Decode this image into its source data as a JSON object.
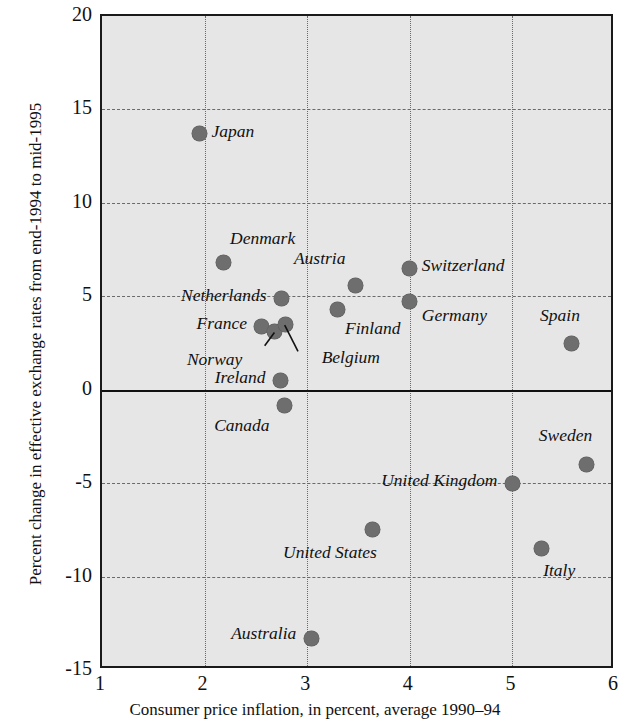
{
  "chart_data": {
    "type": "scatter",
    "title": "",
    "xlabel": "Consumer price inflation, in percent, average 1990–94",
    "ylabel": "Percent change in effective exchange rates from end-1994 to mid-1995",
    "xlim": [
      1,
      6
    ],
    "ylim": [
      -15,
      20
    ],
    "xticks": [
      "1",
      "2",
      "3",
      "4",
      "5",
      "6"
    ],
    "yticks": [
      "20",
      "15",
      "10",
      "5",
      "0",
      "-5",
      "-10",
      "-15"
    ],
    "grid": "dashed horizontal and dotted vertical gridlines at each tick",
    "zero_line": 0,
    "legend": "none",
    "marker_color": "#6e6e6e",
    "plot_background": "#e6e6e6",
    "points": [
      {
        "label": "Japan",
        "x": 1.95,
        "y": 13.7,
        "label_side": "left",
        "label_dx": 14,
        "label_dy": 0
      },
      {
        "label": "Denmark",
        "x": 2.18,
        "y": 6.8,
        "label_side": "left",
        "label_dx": 9,
        "label_dy": -22
      },
      {
        "label": "Netherlands",
        "x": 2.75,
        "y": 4.9,
        "label_side": "right",
        "label_dx": -13,
        "label_dy": 0
      },
      {
        "label": "France",
        "x": 2.55,
        "y": 3.4,
        "label_side": "right",
        "label_dx": -12,
        "label_dy": 0
      },
      {
        "label": "Norway",
        "x": 2.68,
        "y": 3.1,
        "label_side": "right",
        "label_dx": -30,
        "label_dy": 30
      },
      {
        "label": "Belgium",
        "x": 2.79,
        "y": 3.5,
        "label_side": "left",
        "label_dx": 38,
        "label_dy": 36
      },
      {
        "label": "Ireland",
        "x": 2.74,
        "y": 0.5,
        "label_side": "right",
        "label_dx": -13,
        "label_dy": 0
      },
      {
        "label": "Canada",
        "x": 2.78,
        "y": -0.85,
        "label_side": "right",
        "label_dx": -13,
        "label_dy": 22
      },
      {
        "label": "Finland",
        "x": 3.3,
        "y": 4.3,
        "label_side": "left",
        "label_dx": 9,
        "label_dy": 22
      },
      {
        "label": "Austria",
        "x": 3.47,
        "y": 5.6,
        "label_side": "right",
        "label_dx": -8,
        "label_dy": -24
      },
      {
        "label": "Switzerland",
        "x": 4.0,
        "y": 6.5,
        "label_side": "left",
        "label_dx": 14,
        "label_dy": 0
      },
      {
        "label": "Germany",
        "x": 4.0,
        "y": 4.7,
        "label_side": "left",
        "label_dx": 14,
        "label_dy": 16
      },
      {
        "label": "Spain",
        "x": 5.58,
        "y": 2.45,
        "label_side": "right",
        "label_dx": 10,
        "label_dy": -26
      },
      {
        "label": "United Kingdom",
        "x": 5.0,
        "y": -5.0,
        "label_side": "right",
        "label_dx": -13,
        "label_dy": 0
      },
      {
        "label": "Sweden",
        "x": 5.72,
        "y": -4.0,
        "label_side": "right",
        "label_dx": 8,
        "label_dy": -26
      },
      {
        "label": "United States",
        "x": 3.64,
        "y": -7.5,
        "label_side": "right",
        "label_dx": 6,
        "label_dy": 25
      },
      {
        "label": "Italy",
        "x": 5.28,
        "y": -8.5,
        "label_side": "left",
        "label_dx": 4,
        "label_dy": 24
      },
      {
        "label": "Australia",
        "x": 3.04,
        "y": -13.3,
        "label_side": "right",
        "label_dx": -13,
        "label_dy": -2
      }
    ],
    "leaders": [
      {
        "from_label": "Norway",
        "x1": 2.605,
        "y1": 2.25,
        "x2": 2.7,
        "y2": 2.95
      },
      {
        "from_label": "Belgium",
        "x1": 2.93,
        "y1": 1.95,
        "x2": 2.8,
        "y2": 3.35
      }
    ]
  },
  "axes": {
    "x_title": "Consumer price inflation, in percent, average 1990–94",
    "y_title": "Percent change in effective exchange rates from end-1994 to mid-1995"
  }
}
